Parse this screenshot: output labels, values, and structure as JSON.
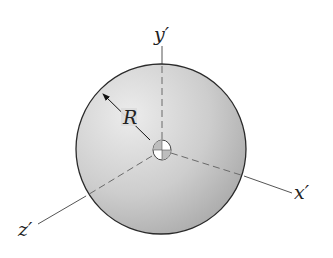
{
  "diagram": {
    "type": "sphere-with-axes",
    "labels": {
      "y_axis": "y′",
      "x_axis": "x′",
      "z_axis": "z′",
      "radius": "R"
    },
    "colors": {
      "sphere_fill_light": "#e8e8e8",
      "sphere_fill_dark": "#a9a9a9",
      "outline": "#2a2a2a",
      "axis": "#555555",
      "label": "#222222"
    }
  }
}
